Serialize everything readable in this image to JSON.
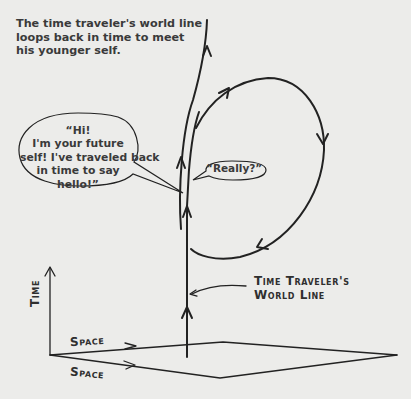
{
  "caption": {
    "lines": [
      "The time traveler's world line",
      "loops back in time to meet",
      "his younger self."
    ]
  },
  "bubbles": {
    "future_self": {
      "lines": [
        "“Hi!",
        "I'm your future",
        "self! I've traveled back",
        "in time to say",
        "hello!”"
      ]
    },
    "younger_self": {
      "text": "“Really?”"
    }
  },
  "labels": {
    "world_line": [
      "Time Traveler's",
      "World Line"
    ],
    "time_axis": "Time",
    "space_axis_1": "Space",
    "space_axis_2": "Space"
  },
  "colors": {
    "background": "#ececea",
    "ink": "#222222"
  }
}
